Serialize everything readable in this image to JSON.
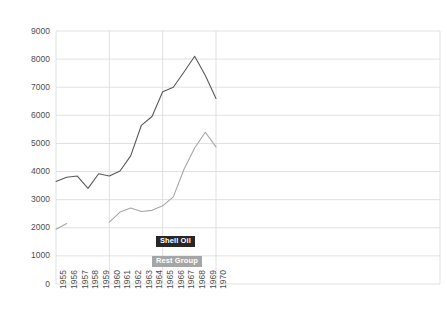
{
  "chart_data": {
    "type": "line",
    "title": "",
    "subtitle": "",
    "xlabel": "",
    "ylabel": "",
    "x": [
      1955,
      1956,
      1957,
      1958,
      1959,
      1960,
      1961,
      1962,
      1963,
      1964,
      1965,
      1966,
      1967,
      1968,
      1969,
      1970
    ],
    "xlim": [
      1955,
      1970
    ],
    "ylim": [
      0,
      9000
    ],
    "ytick_values": [
      0,
      1000,
      2000,
      3000,
      4000,
      5000,
      6000,
      7000,
      8000,
      9000
    ],
    "ytick_labels": [
      "0",
      "1000",
      "2000",
      "3000",
      "4000",
      "5000",
      "6000",
      "7000",
      "8000",
      "9000"
    ],
    "xtick_labels": [
      "1955",
      "1956",
      "1957",
      "1958",
      "1959",
      "1960",
      "1961",
      "1962",
      "1963",
      "1964",
      "1965",
      "1966",
      "1967",
      "1968",
      "1969",
      "1970"
    ],
    "grid": true,
    "grid_horizontal": true,
    "grid_vertical": true,
    "legend_position": "inside-center",
    "series": [
      {
        "name": "Shell Oil",
        "color": "#595959",
        "values": [
          3650,
          3800,
          3840,
          3400,
          3920,
          3840,
          4020,
          4560,
          5640,
          5960,
          6840,
          7000,
          7540,
          8100,
          7420,
          6600
        ]
      },
      {
        "name": "Rest Group",
        "color": "#a6a6a6",
        "values": [
          1950,
          2150,
          null,
          null,
          null,
          2200,
          2560,
          2700,
          2580,
          2620,
          2780,
          3100,
          4080,
          4840,
          5400,
          4880
        ]
      }
    ]
  },
  "legend": {
    "items": [
      {
        "label": "Shell Oil",
        "color": "#262626"
      },
      {
        "label": "Rest Group",
        "color": "#a6a6a6"
      }
    ]
  },
  "colors": {
    "background": "#ffffff",
    "grid": "#d9d9d9",
    "tick_text": "#4d4d4d",
    "series_primary": "#595959",
    "series_secondary": "#a6a6a6"
  }
}
